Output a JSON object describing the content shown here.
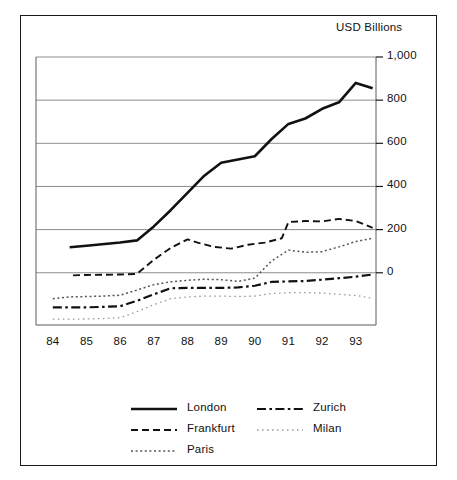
{
  "figure": {
    "axis_title": "USD Billions",
    "border_color": "#1a1a1a",
    "background": "#ffffff"
  },
  "chart_data": {
    "type": "line",
    "title": "",
    "subtitle": "",
    "xlabel": "",
    "ylabel": "USD Billions",
    "axis_title": "USD Billions",
    "grid": true,
    "grid_axis": "y",
    "legend_position": "bottom",
    "x": [
      84,
      85,
      86,
      87,
      88,
      89,
      90,
      91,
      92,
      93
    ],
    "categories": [
      "84",
      "85",
      "86",
      "87",
      "88",
      "89",
      "90",
      "91",
      "92",
      "93"
    ],
    "xtick_labels": [
      "84",
      "85",
      "86",
      "87",
      "88",
      "89",
      "90",
      "91",
      "92",
      "93"
    ],
    "ytick_labels": [
      "1,000",
      "800",
      "600",
      "400",
      "200",
      "0"
    ],
    "ytick_values": [
      1000,
      800,
      600,
      400,
      200,
      0
    ],
    "ylim": [
      -242,
      1000
    ],
    "xlim": [
      83.5,
      93.6
    ],
    "series": [
      {
        "name": "London",
        "style": "solid",
        "color": "#111111",
        "width": 2.6,
        "x": [
          84.5,
          85,
          86,
          86.5,
          87,
          87.5,
          88,
          88.5,
          89,
          89.5,
          90,
          90.5,
          91,
          91.5,
          92,
          92.5,
          93,
          93.5
        ],
        "values": [
          118,
          125,
          140,
          150,
          215,
          290,
          370,
          450,
          510,
          525,
          540,
          620,
          690,
          715,
          760,
          790,
          880,
          855
        ]
      },
      {
        "name": "Frankfurt",
        "style": "dashed",
        "color": "#111111",
        "width": 1.9,
        "x": [
          84.6,
          85,
          85.5,
          86,
          86.5,
          87,
          87.5,
          88,
          88.3,
          88.8,
          89.3,
          89.8,
          90.3,
          90.8,
          91,
          91.5,
          92,
          92.5,
          93,
          93.5
        ],
        "values": [
          -12,
          -10,
          -9,
          -8,
          -5,
          60,
          115,
          155,
          140,
          120,
          112,
          130,
          140,
          160,
          235,
          240,
          238,
          250,
          240,
          208
        ]
      },
      {
        "name": "Paris",
        "style": "dotted",
        "color": "#555555",
        "width": 1.5,
        "x": [
          84,
          84.5,
          85,
          85.5,
          86,
          86.5,
          87,
          87.5,
          88,
          88.5,
          89,
          89.5,
          90,
          90.5,
          91,
          91.5,
          92,
          92.5,
          93,
          93.5
        ],
        "values": [
          -120,
          -112,
          -110,
          -108,
          -104,
          -80,
          -55,
          -42,
          -35,
          -30,
          -32,
          -40,
          -25,
          55,
          105,
          95,
          98,
          120,
          145,
          160
        ]
      },
      {
        "name": "Zurich",
        "style": "dashdot",
        "color": "#111111",
        "width": 2.2,
        "x": [
          84,
          84.5,
          85,
          85.5,
          86,
          86.5,
          87,
          87.5,
          88,
          88.5,
          89,
          89.5,
          90,
          90.5,
          91,
          91.5,
          92,
          92.5,
          93,
          93.5
        ],
        "values": [
          -160,
          -160,
          -160,
          -158,
          -155,
          -130,
          -100,
          -72,
          -70,
          -70,
          -70,
          -68,
          -60,
          -42,
          -40,
          -38,
          -32,
          -25,
          -18,
          -8
        ]
      },
      {
        "name": "Milan",
        "style": "finedotted",
        "color": "#9a9a9a",
        "width": 1.3,
        "x": [
          84,
          84.5,
          85,
          85.5,
          86,
          86.5,
          87,
          87.5,
          88,
          88.5,
          89,
          89.5,
          90,
          90.5,
          91,
          91.5,
          92,
          92.5,
          93,
          93.5
        ],
        "values": [
          -215,
          -215,
          -214,
          -212,
          -208,
          -180,
          -148,
          -120,
          -112,
          -108,
          -108,
          -110,
          -108,
          -96,
          -92,
          -92,
          -94,
          -100,
          -105,
          -118
        ]
      }
    ]
  },
  "legend": {
    "columns": [
      {
        "items": [
          {
            "label": "London",
            "style": "solid"
          },
          {
            "label": "Frankfurt",
            "style": "dashed"
          },
          {
            "label": "Paris",
            "style": "dotted"
          }
        ]
      },
      {
        "items": [
          {
            "label": "Zurich",
            "style": "dashdot"
          },
          {
            "label": "Milan",
            "style": "finedotted"
          }
        ]
      }
    ]
  }
}
